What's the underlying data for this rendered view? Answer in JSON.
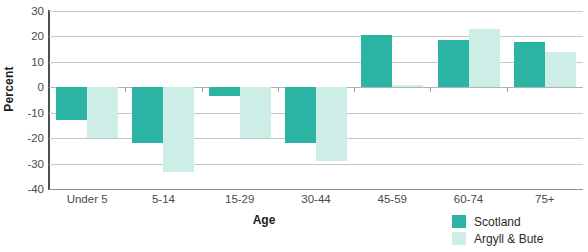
{
  "chart_data": {
    "type": "bar",
    "title": "",
    "xlabel": "Age",
    "ylabel": "Percent",
    "categories": [
      "Under 5",
      "5-14",
      "15-29",
      "30-44",
      "45-59",
      "60-74",
      "75+"
    ],
    "series": [
      {
        "name": "Scotland",
        "color": "#2bb3a3",
        "values": [
          -13,
          -22,
          -3.5,
          -22,
          20.5,
          18.5,
          18
        ]
      },
      {
        "name": "Argyll & Bute",
        "color": "#cceee6",
        "values": [
          -20,
          -33.5,
          -20,
          -29,
          1,
          23,
          14
        ]
      }
    ],
    "ylim": [
      -40,
      30
    ],
    "yticks": [
      30,
      20,
      10,
      0,
      -10,
      -20,
      -30,
      -40
    ],
    "ytick_labels": [
      "30",
      "20",
      "10",
      "0",
      "-10",
      "-20",
      "-30",
      "-40"
    ],
    "grid": true,
    "legend_position": "bottom-right"
  },
  "legend": {
    "items": [
      {
        "label": "Scotland",
        "swatch": "scotland"
      },
      {
        "label": "Argyll & Bute",
        "swatch": "argyll"
      }
    ]
  }
}
